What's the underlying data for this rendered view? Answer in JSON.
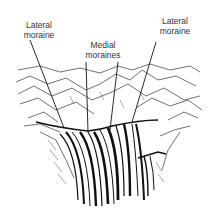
{
  "diagram": {
    "labels": {
      "lateral_left": [
        "Lateral",
        "moraine"
      ],
      "medial": [
        "Medial",
        "moraines"
      ],
      "lateral_right": [
        "Lateral",
        "moraine"
      ]
    },
    "colors": {
      "ink": "#1a1a1a",
      "background": "#ffffff"
    }
  }
}
